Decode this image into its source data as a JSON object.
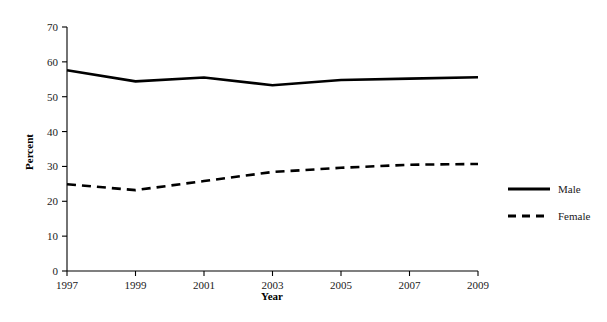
{
  "chart_data": {
    "type": "line",
    "title": "",
    "xlabel": "Year",
    "ylabel": "Percent",
    "x": [
      1997,
      1999,
      2001,
      2003,
      2005,
      2007,
      2009
    ],
    "categories": [
      "1997",
      "1999",
      "2001",
      "2003",
      "2005",
      "2007",
      "2009"
    ],
    "series": [
      {
        "name": "Male",
        "style": "solid",
        "color": "#000000",
        "values": [
          57.6,
          54.4,
          55.5,
          53.3,
          54.8,
          55.2,
          55.6
        ]
      },
      {
        "name": "Female",
        "style": "dashed",
        "color": "#000000",
        "values": [
          24.9,
          23.2,
          25.8,
          28.4,
          29.6,
          30.5,
          30.7
        ]
      }
    ],
    "xlim": [
      1997,
      2009
    ],
    "ylim": [
      0,
      70
    ],
    "yticks": [
      0,
      10,
      20,
      30,
      40,
      50,
      60,
      70
    ],
    "ytick_labels": [
      "0",
      "10",
      "20",
      "30",
      "40",
      "50",
      "60",
      "70"
    ],
    "xticks": [
      1997,
      1999,
      2001,
      2003,
      2005,
      2007,
      2009
    ],
    "xtick_labels": [
      "1997",
      "1999",
      "2001",
      "2003",
      "2005",
      "2007",
      "2009"
    ],
    "grid": false,
    "legend_position": "right",
    "legend": [
      {
        "label": "Male",
        "style": "solid"
      },
      {
        "label": "Female",
        "style": "dashed"
      }
    ]
  }
}
